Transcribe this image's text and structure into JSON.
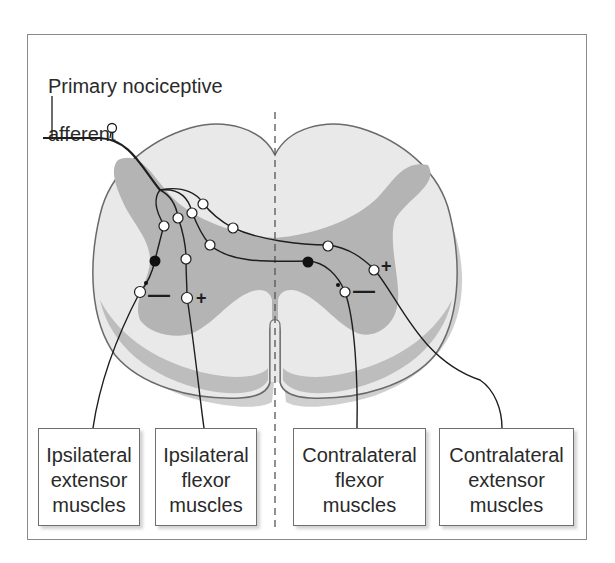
{
  "diagram": {
    "title_line1": "Primary nociceptive",
    "title_line2": "afferent",
    "colors": {
      "white_matter": "#e9e9e9",
      "gray_matter": "#b4b4b4",
      "outline": "#6a6a6a",
      "axon": "#1e1e1e",
      "midline": "#555555"
    },
    "signs": {
      "ipsilateral_extensor": "—",
      "ipsilateral_flexor": "+",
      "contralateral_flexor": "—",
      "contralateral_extensor": "+"
    },
    "muscle_boxes": [
      {
        "line1": "Ipsilateral",
        "line2": "extensor",
        "line3": "muscles"
      },
      {
        "line1": "Ipsilateral",
        "line2": "flexor",
        "line3": "muscles"
      },
      {
        "line1": "Contralateral",
        "line2": "flexor",
        "line3": "muscles"
      },
      {
        "line1": "Contralateral",
        "line2": "extensor",
        "line3": "muscles"
      }
    ]
  }
}
